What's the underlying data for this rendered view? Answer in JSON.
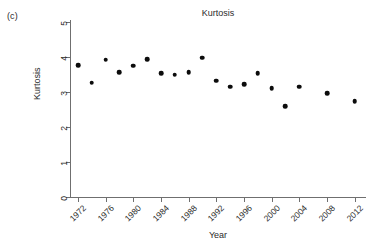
{
  "panel": {
    "label": "(c)"
  },
  "chart_data": {
    "type": "scatter",
    "title": "Kurtosis",
    "xlabel": "Year",
    "ylabel": "Kurtosis",
    "xlim": [
      1971,
      2013.5
    ],
    "ylim": [
      0,
      5
    ],
    "grid": false,
    "legend": null,
    "xticks": [
      1972,
      1976,
      1980,
      1984,
      1988,
      1992,
      1996,
      2000,
      2004,
      2008,
      2012
    ],
    "xtick_labels": [
      "1972",
      "1976",
      "1980",
      "1984",
      "1988",
      "1992",
      "1996",
      "2000",
      "2004",
      "2008",
      "2012"
    ],
    "yticks": [
      0,
      1,
      2,
      3,
      4,
      5
    ],
    "ytick_labels": [
      "0",
      "1",
      "2",
      "3",
      "4",
      "5"
    ],
    "marker": "filled-circle",
    "marker_color": "#0c0c0c",
    "x": [
      1972,
      1974,
      1976,
      1978,
      1980,
      1982,
      1984,
      1986,
      1988,
      1990,
      1992,
      1994,
      1996,
      1998,
      2000,
      2002,
      2004,
      2008,
      2012
    ],
    "y": [
      3.77,
      3.27,
      3.92,
      3.57,
      3.75,
      3.93,
      3.53,
      3.5,
      3.57,
      3.98,
      3.32,
      3.15,
      3.23,
      3.53,
      3.11,
      2.6,
      3.15,
      2.96,
      2.73
    ]
  }
}
